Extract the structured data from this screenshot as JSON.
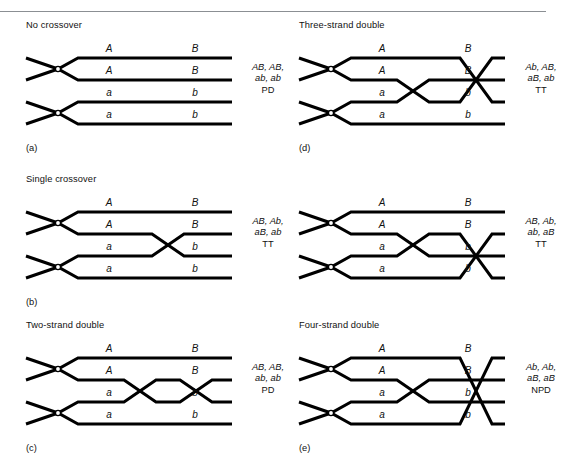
{
  "figure": {
    "top_rule": true,
    "stroke_color": "#000000",
    "text_color": "#111111"
  },
  "panels": [
    {
      "id": "a",
      "letter": "(a)",
      "title": "No crossover",
      "strands": [
        {
          "left_allele": "A",
          "right_allele": "B"
        },
        {
          "left_allele": "A",
          "right_allele": "B"
        },
        {
          "left_allele": "a",
          "right_allele": "b"
        },
        {
          "left_allele": "a",
          "right_allele": "b"
        }
      ],
      "outcome_line1": "AB, AB,",
      "outcome_line2": "ab, ab",
      "outcome_type": "PD",
      "crossovers": []
    },
    {
      "id": "b",
      "letter": "(b)",
      "title": "Single crossover",
      "strands": [
        {
          "left_allele": "A",
          "right_allele": "B"
        },
        {
          "left_allele": "A",
          "right_allele": "B"
        },
        {
          "left_allele": "a",
          "right_allele": "b"
        },
        {
          "left_allele": "a",
          "right_allele": "b"
        }
      ],
      "outcome_line1": "AB, Ab,",
      "outcome_line2": "aB, ab",
      "outcome_type": "TT",
      "crossovers": [
        {
          "rows": [
            2,
            3
          ],
          "center_x": 168
        }
      ]
    },
    {
      "id": "c",
      "letter": "(c)",
      "title": "Two-strand double",
      "strands": [
        {
          "left_allele": "A",
          "right_allele": "B"
        },
        {
          "left_allele": "A",
          "right_allele": "B"
        },
        {
          "left_allele": "a",
          "right_allele": "b"
        },
        {
          "left_allele": "a",
          "right_allele": "b"
        }
      ],
      "outcome_line1": "AB, AB,",
      "outcome_line2": "ab, ab",
      "outcome_type": "PD",
      "crossovers": [
        {
          "rows": [
            2,
            3
          ],
          "center_x": 140
        },
        {
          "rows": [
            2,
            3
          ],
          "center_x": 196
        }
      ]
    },
    {
      "id": "d",
      "letter": "(d)",
      "title": "Three-strand double",
      "strands": [
        {
          "left_allele": "A",
          "right_allele": "B"
        },
        {
          "left_allele": "A",
          "right_allele": "B"
        },
        {
          "left_allele": "a",
          "right_allele": "b"
        },
        {
          "left_allele": "a",
          "right_allele": "b"
        }
      ],
      "outcome_line1": "Ab, AB,",
      "outcome_line2": "aB, ab",
      "outcome_type": "TT",
      "crossovers": [
        {
          "rows": [
            2,
            3
          ],
          "center_x": 140
        },
        {
          "rows": [
            1,
            3
          ],
          "center_x": 203
        }
      ]
    },
    {
      "id": "d2",
      "letter": "",
      "title": "",
      "strands": [
        {
          "left_allele": "A",
          "right_allele": "B"
        },
        {
          "left_allele": "A",
          "right_allele": "B"
        },
        {
          "left_allele": "a",
          "right_allele": "b"
        },
        {
          "left_allele": "a",
          "right_allele": "b"
        }
      ],
      "outcome_line1": "AB, Ab,",
      "outcome_line2": "ab, aB",
      "outcome_type": "TT",
      "crossovers": [
        {
          "rows": [
            2,
            3
          ],
          "center_x": 140
        },
        {
          "rows": [
            2,
            4
          ],
          "center_x": 203
        }
      ]
    },
    {
      "id": "e",
      "letter": "(e)",
      "title": "Four-strand double",
      "strands": [
        {
          "left_allele": "A",
          "right_allele": "B"
        },
        {
          "left_allele": "A",
          "right_allele": "B"
        },
        {
          "left_allele": "a",
          "right_allele": "b"
        },
        {
          "left_allele": "a",
          "right_allele": "b"
        }
      ],
      "outcome_line1": "Ab, Ab,",
      "outcome_line2": "aB, aB",
      "outcome_type": "NPD",
      "crossovers": [
        {
          "rows": [
            2,
            3
          ],
          "center_x": 140
        },
        {
          "rows": [
            1,
            4
          ],
          "center_x": 203
        }
      ]
    }
  ]
}
